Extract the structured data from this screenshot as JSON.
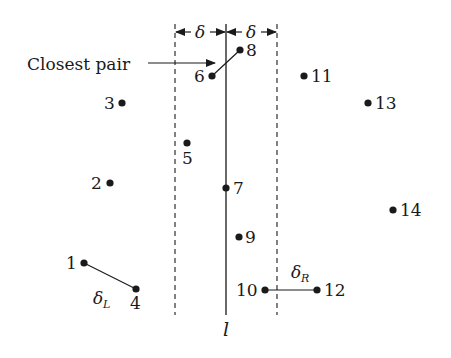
{
  "diagram": {
    "caption_label": "Closest pair",
    "dividing_line_label": "l",
    "delta_symbol": "δ",
    "delta_left_label": "δ",
    "delta_left_sub": "L",
    "delta_right_label": "δ",
    "delta_right_sub": "R",
    "colors": {
      "ink": "#1a1a1a",
      "background": "#ffffff"
    },
    "points": [
      {
        "id": "1",
        "label": "1",
        "x": 84,
        "y": 263
      },
      {
        "id": "2",
        "label": "2",
        "x": 110,
        "y": 183
      },
      {
        "id": "3",
        "label": "3",
        "x": 122,
        "y": 103
      },
      {
        "id": "4",
        "label": "4",
        "x": 136,
        "y": 289
      },
      {
        "id": "5",
        "label": "5",
        "x": 187,
        "y": 143
      },
      {
        "id": "6",
        "label": "6",
        "x": 212,
        "y": 76
      },
      {
        "id": "7",
        "label": "7",
        "x": 226,
        "y": 188
      },
      {
        "id": "8",
        "label": "8",
        "x": 240,
        "y": 50
      },
      {
        "id": "9",
        "label": "9",
        "x": 239,
        "y": 237
      },
      {
        "id": "10",
        "label": "10",
        "x": 265,
        "y": 290
      },
      {
        "id": "11",
        "label": "11",
        "x": 304,
        "y": 76
      },
      {
        "id": "12",
        "label": "12",
        "x": 317,
        "y": 290
      },
      {
        "id": "13",
        "label": "13",
        "x": 368,
        "y": 103
      },
      {
        "id": "14",
        "label": "14",
        "x": 393,
        "y": 210
      }
    ],
    "pairs": [
      {
        "name": "closest-pair",
        "from": "6",
        "to": "8"
      },
      {
        "name": "delta-left-pair",
        "from": "1",
        "to": "4"
      },
      {
        "name": "delta-right-pair",
        "from": "10",
        "to": "12"
      }
    ],
    "strip": {
      "left_x": 175,
      "center_x": 226,
      "right_x": 277
    }
  }
}
